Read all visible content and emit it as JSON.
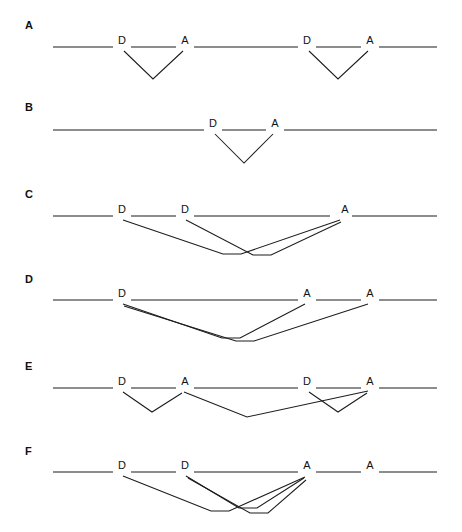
{
  "figure": {
    "background_color": "#ffffff",
    "line_color": "#1c1c1c",
    "label_color": "#111111",
    "width": 462,
    "height": 532
  },
  "panels": [
    {
      "letter": "A",
      "letter_x": 25,
      "letter_y": 29,
      "baseline_y": 47,
      "line_start_x": 53,
      "line_end_x": 437,
      "labels": [
        {
          "text": "D",
          "x": 122,
          "y": 44
        },
        {
          "text": "A",
          "x": 185,
          "y": 44
        },
        {
          "text": "D",
          "x": 307,
          "y": 44
        },
        {
          "text": "A",
          "x": 370,
          "y": 44
        }
      ]
    },
    {
      "letter": "B",
      "letter_x": 25,
      "letter_y": 111,
      "baseline_y": 130,
      "line_start_x": 53,
      "line_end_x": 437,
      "labels": [
        {
          "text": "D",
          "x": 213,
          "y": 127
        },
        {
          "text": "A",
          "x": 275,
          "y": 127
        }
      ]
    },
    {
      "letter": "C",
      "letter_x": 25,
      "letter_y": 198,
      "baseline_y": 216,
      "line_start_x": 53,
      "line_end_x": 437,
      "labels": [
        {
          "text": "D",
          "x": 122,
          "y": 213
        },
        {
          "text": "D",
          "x": 185,
          "y": 213
        },
        {
          "text": "A",
          "x": 345,
          "y": 213
        }
      ]
    },
    {
      "letter": "D",
      "letter_x": 25,
      "letter_y": 283,
      "baseline_y": 300,
      "line_start_x": 53,
      "line_end_x": 437,
      "labels": [
        {
          "text": "D",
          "x": 122,
          "y": 297
        },
        {
          "text": "A",
          "x": 307,
          "y": 297
        },
        {
          "text": "A",
          "x": 370,
          "y": 297
        }
      ]
    },
    {
      "letter": "E",
      "letter_x": 25,
      "letter_y": 370,
      "baseline_y": 388,
      "line_start_x": 53,
      "line_end_x": 437,
      "labels": [
        {
          "text": "D",
          "x": 122,
          "y": 385
        },
        {
          "text": "A",
          "x": 185,
          "y": 385
        },
        {
          "text": "D",
          "x": 307,
          "y": 385
        },
        {
          "text": "A",
          "x": 370,
          "y": 385
        }
      ]
    },
    {
      "letter": "F",
      "letter_x": 25,
      "letter_y": 455,
      "baseline_y": 472,
      "line_start_x": 53,
      "line_end_x": 437,
      "labels": [
        {
          "text": "D",
          "x": 122,
          "y": 469
        },
        {
          "text": "D",
          "x": 185,
          "y": 469
        },
        {
          "text": "A",
          "x": 307,
          "y": 469
        },
        {
          "text": "A",
          "x": 370,
          "y": 469
        }
      ]
    }
  ],
  "geometry": {
    "panel_a": {
      "backbone_segments": [
        "M53,47 L113,47",
        "M131,47 L176,47",
        "M194,47 L298,47",
        "M316,47 L361,47",
        "M379,47 L437,47"
      ],
      "loops": [
        "M124,51 L153,79 L183,51",
        "M309,51 L338,79 L368,51"
      ]
    },
    "panel_b": {
      "backbone_segments": [
        "M53,130 L204,130",
        "M222,130 L266,130",
        "M284,130 L437,130"
      ],
      "loops": [
        "M215,134 L244,163 L273,134"
      ]
    },
    "panel_c": {
      "backbone_segments": [
        "M53,216 L113,216",
        "M131,216 L176,216",
        "M194,216 L330,216",
        "M352,216 L437,216"
      ],
      "loops": [
        "M123,220 L223,254 L241,254 L340,220",
        "M186,220 L253,255 L271,255 L341,222"
      ]
    },
    "panel_d": {
      "backbone_segments": [
        "M53,300 L113,300",
        "M131,300 L298,300",
        "M316,300 L361,300",
        "M379,300 L437,300"
      ],
      "loops": [
        "M123,304 L222,338 L240,338 L305,304",
        "M124,306 L236,341 L254,341 L368,304"
      ]
    },
    "panel_e": {
      "backbone_segments": [
        "M53,388 L113,388",
        "M131,388 L176,388",
        "M194,388 L298,388",
        "M316,388 L361,388",
        "M379,388 L437,388"
      ],
      "loops": [
        "M123,392 L152,412 L182,393",
        "M309,392 L338,412 L367,393",
        "M184,392 L247,417 L368,391"
      ]
    },
    "panel_f": {
      "backbone_segments": [
        "M53,472 L113,472",
        "M131,472 L176,472",
        "M194,472 L298,472",
        "M316,472 L361,472",
        "M379,472 L437,472"
      ],
      "loops": [
        "M123,476 L211,511 L229,511 L305,477",
        "M186,476 L239,508 L257,508 L304,478",
        "M188,478 L250,513 L268,513 L306,480"
      ]
    }
  }
}
